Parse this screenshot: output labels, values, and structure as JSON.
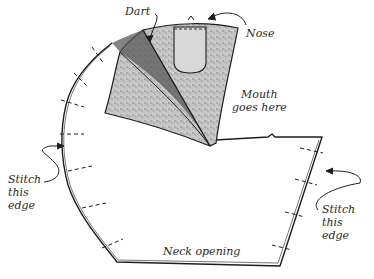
{
  "diagram": {
    "labels": {
      "dart": "Dart",
      "nose": "Nose",
      "mouth": "Mouth\ngoes here",
      "stitch_left": "Stitch\nthis\nedge",
      "stitch_right": "Stitch\nthis\nedge",
      "neck": "Neck opening"
    },
    "colors": {
      "ink": "#1e1e1e",
      "fabric_fill": "#bdbdbd",
      "background": "#ffffff"
    }
  }
}
